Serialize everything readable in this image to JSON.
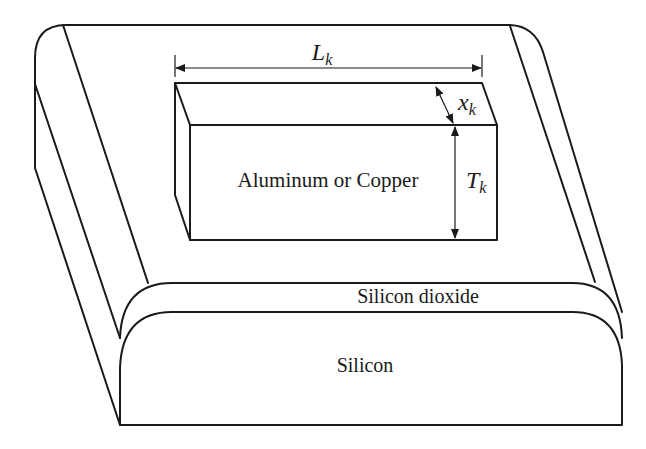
{
  "figure": {
    "stroke_color": "#1a1a1a",
    "background": "#ffffff"
  },
  "labels": {
    "metal": "Aluminum or Copper",
    "oxide": "Silicon dioxide",
    "substrate": "Silicon"
  },
  "dimensions": {
    "length": {
      "symbol": "L",
      "subscript": "k"
    },
    "width": {
      "symbol": "x",
      "subscript": "k"
    },
    "thickness": {
      "symbol": "T",
      "subscript": "k"
    }
  }
}
